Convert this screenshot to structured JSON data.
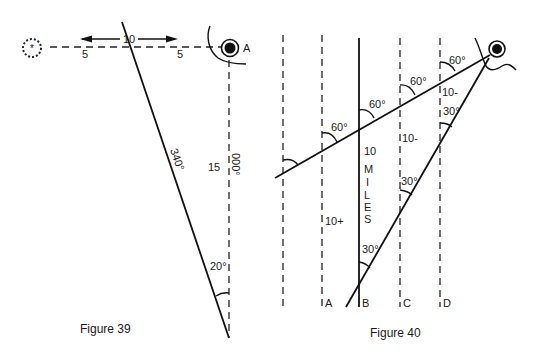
{
  "figure39": {
    "caption": "Figure 39",
    "point_label": "A",
    "distance_total": "10",
    "distance_left": "5",
    "distance_right": "5",
    "bearing_label": "340°",
    "vertical_distance": "15",
    "vertical_bearing": "000°",
    "angle_label": "20°"
  },
  "figure40": {
    "caption": "Figure 40",
    "angle_labels": [
      "60°",
      "60°",
      "60°",
      "60°",
      "30°",
      "30°",
      "30°"
    ],
    "line_labels": [
      "A",
      "B",
      "C",
      "D"
    ],
    "distance_labels": {
      "a": "10+",
      "b": "10",
      "b_units": [
        "M",
        "I",
        "L",
        "E",
        "S"
      ],
      "c": "10-",
      "d": "10-"
    }
  }
}
